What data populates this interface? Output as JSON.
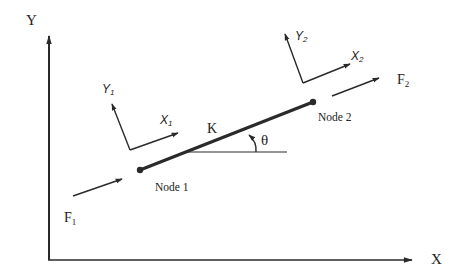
{
  "diagram": {
    "type": "spring-element-free-body",
    "colors": {
      "stroke": "#2a2a2a",
      "text": "#222222",
      "background": "#ffffff"
    },
    "global_axes": {
      "x_label": "X",
      "y_label": "Y"
    },
    "element": {
      "stiffness_label": "K",
      "angle_label": "θ"
    },
    "nodes": [
      {
        "label": "Node 1"
      },
      {
        "label": "Node 2"
      }
    ],
    "local_frames": [
      {
        "x_label": "X",
        "x_sub": "1",
        "y_label": "Y",
        "y_sub": "1"
      },
      {
        "x_label": "X",
        "x_sub": "2",
        "y_label": "Y",
        "y_sub": "2"
      }
    ],
    "forces": [
      {
        "label": "F",
        "sub": "1"
      },
      {
        "label": "F",
        "sub": "2"
      }
    ]
  }
}
